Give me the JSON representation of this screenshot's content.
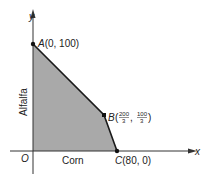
{
  "diagram": {
    "type": "feasible-region",
    "colors": {
      "region_fill": "#a9a9a9",
      "line": "#1a1a1a",
      "background": "#ffffff"
    },
    "axes": {
      "x_label": "x",
      "y_label": "y",
      "origin_label": "O",
      "x_title": "Corn",
      "y_title": "Alfalfa"
    },
    "points": {
      "A": {
        "name": "A",
        "coords": "(0, 100)"
      },
      "B": {
        "name": "B",
        "x_num": "200",
        "x_den": "3",
        "y_num": "100",
        "y_den": "3"
      },
      "C": {
        "name": "C",
        "coords": "(80, 0)"
      }
    }
  }
}
